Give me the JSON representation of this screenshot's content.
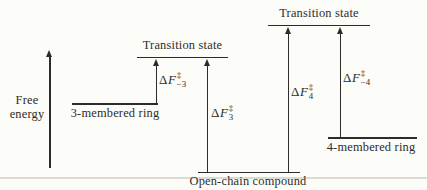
{
  "figure": {
    "axis": {
      "lines": [
        "Free",
        "energy"
      ]
    },
    "transition_state_3": "Transition state",
    "transition_state_4": "Transition state",
    "level_ring3": "3-membered ring",
    "level_ring4": "4-membered ring",
    "level_open_chain": "Open-chain compound",
    "energy_labels": {
      "forward3": {
        "delta": "Δ",
        "symbol": "F",
        "sup": "‡",
        "sub": "3"
      },
      "reverse3": {
        "delta": "Δ",
        "symbol": "F",
        "sup": "‡",
        "sub": "−3"
      },
      "forward4": {
        "delta": "Δ",
        "symbol": "F",
        "sup": "‡",
        "sub": "4"
      },
      "reverse4": {
        "delta": "Δ",
        "symbol": "F",
        "sup": "‡",
        "sub": "−4"
      }
    },
    "colors": {
      "ink": "#2e2c2a",
      "paper": "#fcfcf9",
      "faint_rule": "#dbdbd4"
    }
  }
}
